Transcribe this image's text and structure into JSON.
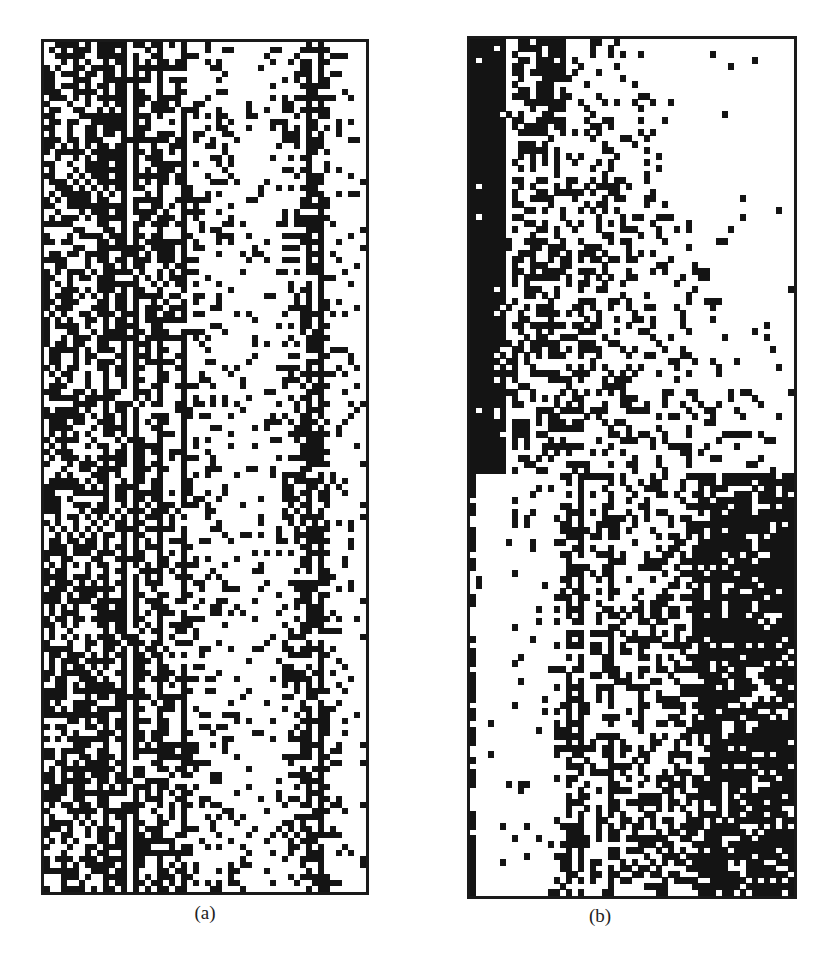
{
  "figure": {
    "panels": [
      {
        "id": "a",
        "caption": "(a)",
        "cols": 54,
        "rows": 142,
        "cell_px": 6,
        "seed": 1337,
        "description": "space-time pattern with persistent vertical stripes on the left, sparse dots in the middle, and a dense stripe band near the right",
        "column_density": [
          0.55,
          0.6,
          0.5,
          0.65,
          0.55,
          0.6,
          0.45,
          0.7,
          0.5,
          0.55,
          0.85,
          0.5,
          0.6,
          0.85,
          0.2,
          0.85,
          0.5,
          0.55,
          0.45,
          0.85,
          0.4,
          0.5,
          0.35,
          0.85,
          0.3,
          0.35,
          0.25,
          0.3,
          0.2,
          0.25,
          0.15,
          0.2,
          0.15,
          0.12,
          0.15,
          0.1,
          0.12,
          0.1,
          0.15,
          0.2,
          0.25,
          0.35,
          0.5,
          0.55,
          0.85,
          0.5,
          0.85,
          0.35,
          0.2,
          0.15,
          0.12,
          0.1,
          0.08,
          0.1
        ],
        "stripe_columns": [
          10,
          13,
          15,
          19,
          23,
          44,
          46
        ]
      },
      {
        "id": "b",
        "caption": "(b)",
        "cols": 54,
        "rows": 142,
        "cell_px": 6,
        "seed": 4242,
        "description": "upper half: solid dark block on far left with dense cluster diffusing to the right; lower half: sparse left, dense striped region to the right",
        "top_split_row": 72,
        "dark_block_cols": 6
      }
    ]
  }
}
